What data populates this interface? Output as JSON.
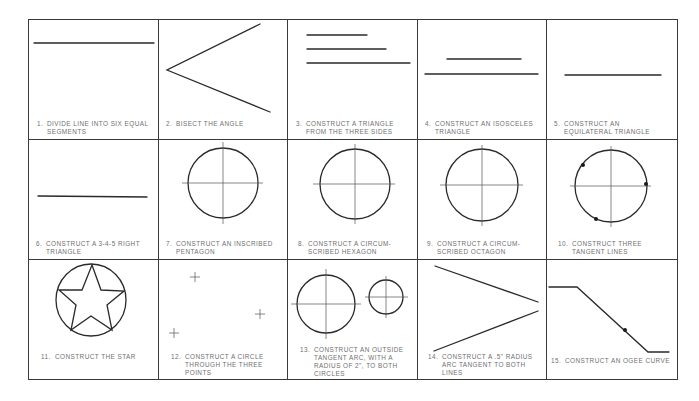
{
  "sheet": {
    "grid": {
      "rows": 3,
      "columns": 5
    },
    "line_color": "#2a2a2a",
    "caption_color": "#707070",
    "problems": [
      {
        "number": "1.",
        "line1": "DIVIDE LINE INTO SIX EQUAL",
        "line2": "SEGMENTS",
        "figure": "single-line"
      },
      {
        "number": "2.",
        "line1": "BISECT THE ANGLE",
        "line2": "",
        "figure": "angle"
      },
      {
        "number": "3.",
        "line1": "CONSTRUCT A TRIANGLE",
        "line2": "FROM THE THREE SIDES",
        "figure": "three-lines"
      },
      {
        "number": "4.",
        "line1": "CONSTRUCT AN ISOSCELES",
        "line2": "TRIANGLE",
        "figure": "two-lines"
      },
      {
        "number": "5.",
        "line1": "CONSTRUCT AN",
        "line2": "EQUILATERAL TRIANGLE",
        "figure": "single-line"
      },
      {
        "number": "6.",
        "line1": "CONSTRUCT A 3-4-5 RIGHT",
        "line2": "TRIANGLE",
        "figure": "single-line"
      },
      {
        "number": "7.",
        "line1": "CONSTRUCT AN INSCRIBED",
        "line2": "PENTAGON",
        "figure": "circle-with-centerlines"
      },
      {
        "number": "8.",
        "line1": "CONSTRUCT A CIRCUM-",
        "line2": "SCRIBED HEXAGON",
        "figure": "circle-with-centerlines"
      },
      {
        "number": "9.",
        "line1": "CONSTRUCT A CIRCUM-",
        "line2": "SCRIBED OCTAGON",
        "figure": "circle-with-centerlines"
      },
      {
        "number": "10.",
        "line1": "CONSTRUCT THREE",
        "line2": "TANGENT LINES",
        "figure": "circle-with-three-points"
      },
      {
        "number": "11.",
        "line1": "CONSTRUCT THE STAR",
        "line2": "",
        "figure": "star-in-circle"
      },
      {
        "number": "12.",
        "line1": "CONSTRUCT A CIRCLE",
        "line2": "THROUGH THE THREE",
        "line3": "POINTS",
        "figure": "three-crosses"
      },
      {
        "number": "13.",
        "line1": "CONSTRUCT AN OUTSIDE",
        "line2": "TANGENT ARC, WITH A",
        "line3": "RADIUS OF 2\", TO BOTH",
        "line4": "CIRCLES",
        "figure": "two-circles"
      },
      {
        "number": "14.",
        "line1": "CONSTRUCT A .5\" RADIUS",
        "line2": "ARC TANGENT TO BOTH",
        "line3": "LINES",
        "figure": "converging-lines"
      },
      {
        "number": "15.",
        "line1": "CONSTRUCT AN OGEE CURVE",
        "line2": "",
        "figure": "stepped-line"
      }
    ]
  }
}
